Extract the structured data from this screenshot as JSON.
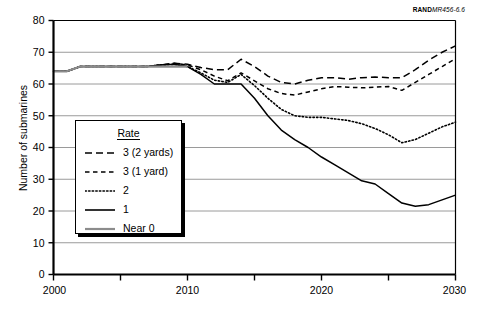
{
  "source_note": {
    "bold": "RAND",
    "italic": "MR456-6.6"
  },
  "legend": {
    "title": "Rate",
    "items": [
      {
        "label": "3 (2 yards)",
        "style": "long-dash",
        "color": "#000000"
      },
      {
        "label": "3 (1 yard)",
        "style": "short-dash",
        "color": "#000000"
      },
      {
        "label": "2",
        "style": "dotted",
        "color": "#000000"
      },
      {
        "label": "1",
        "style": "solid",
        "color": "#000000"
      },
      {
        "label": "Near 0",
        "style": "solid",
        "color": "#8c8c8c"
      }
    ]
  },
  "chart_data": {
    "type": "line",
    "title": "",
    "xlabel": "",
    "ylabel": "Number of submarines",
    "xlim": [
      2000,
      2030
    ],
    "ylim": [
      0,
      80
    ],
    "yticks": [
      0,
      10,
      20,
      30,
      40,
      50,
      60,
      70,
      80
    ],
    "ytick_labels": [
      "0",
      "10",
      "20",
      "30",
      "40",
      "50",
      "60",
      "70",
      "80"
    ],
    "xticks": [
      2000,
      2005,
      2010,
      2015,
      2020,
      2025,
      2030
    ],
    "xtick_labels": [
      "2000",
      "",
      "2010",
      "",
      "2020",
      "",
      "2030"
    ],
    "grid": "horizontal",
    "legend_position": "inside-left",
    "series": [
      {
        "name": "3 (2 yards)",
        "style": "long-dash",
        "color": "#000000",
        "x": [
          2000,
          2001,
          2002,
          2003,
          2004,
          2005,
          2006,
          2007,
          2008,
          2009,
          2010,
          2011,
          2012,
          2013,
          2014,
          2015,
          2016,
          2017,
          2018,
          2019,
          2020,
          2021,
          2022,
          2023,
          2024,
          2025,
          2026,
          2027,
          2028,
          2029,
          2030
        ],
        "values": [
          64,
          64,
          65.5,
          65.5,
          65.5,
          65.5,
          65.5,
          65.5,
          66,
          66.5,
          66.2,
          65.2,
          64.5,
          64.5,
          67.8,
          65.5,
          62.5,
          60.5,
          60,
          61.2,
          62,
          62,
          61.5,
          62,
          62.2,
          62,
          62,
          64.5,
          67.5,
          70,
          72
        ]
      },
      {
        "name": "3 (1 yard)",
        "style": "short-dash",
        "color": "#000000",
        "x": [
          2000,
          2001,
          2002,
          2003,
          2004,
          2005,
          2006,
          2007,
          2008,
          2009,
          2010,
          2011,
          2012,
          2013,
          2014,
          2015,
          2016,
          2017,
          2018,
          2019,
          2020,
          2021,
          2022,
          2023,
          2024,
          2025,
          2026,
          2027,
          2028,
          2029,
          2030
        ],
        "values": [
          64,
          64,
          65.5,
          65.5,
          65.5,
          65.5,
          65.5,
          65.5,
          66,
          66.5,
          66,
          64.5,
          62.5,
          61,
          63.5,
          61,
          58.5,
          57,
          56.5,
          57.5,
          58.5,
          59.2,
          59,
          58.8,
          59,
          59.2,
          58,
          60.5,
          63,
          65.5,
          68
        ]
      },
      {
        "name": "2",
        "style": "dotted",
        "color": "#000000",
        "x": [
          2000,
          2001,
          2002,
          2003,
          2004,
          2005,
          2006,
          2007,
          2008,
          2009,
          2010,
          2011,
          2012,
          2013,
          2014,
          2015,
          2016,
          2017,
          2018,
          2019,
          2020,
          2021,
          2022,
          2023,
          2024,
          2025,
          2026,
          2027,
          2028,
          2029,
          2030
        ],
        "values": [
          64,
          64,
          65.5,
          65.5,
          65.5,
          65.5,
          65.5,
          65.5,
          66,
          66.2,
          65.5,
          63.5,
          61.2,
          60.5,
          63,
          59.5,
          55.5,
          52,
          50,
          49.5,
          49.5,
          49,
          48.5,
          47.5,
          46,
          44,
          41.5,
          42.5,
          44.5,
          46.5,
          48
        ]
      },
      {
        "name": "1",
        "style": "solid",
        "color": "#000000",
        "x": [
          2000,
          2001,
          2002,
          2003,
          2004,
          2005,
          2006,
          2007,
          2008,
          2009,
          2010,
          2011,
          2012,
          2013,
          2014,
          2015,
          2016,
          2017,
          2018,
          2019,
          2020,
          2021,
          2022,
          2023,
          2024,
          2025,
          2026,
          2027,
          2028,
          2029,
          2030
        ],
        "values": [
          64,
          64,
          65.5,
          65.5,
          65.5,
          65.5,
          65.5,
          65.5,
          66,
          66.2,
          65.5,
          63,
          60,
          60,
          60,
          55.5,
          50,
          45.5,
          42.5,
          40,
          37,
          34.5,
          32,
          29.5,
          28.5,
          25.5,
          22.5,
          21.5,
          22,
          23.5,
          25
        ]
      },
      {
        "name": "Near 0",
        "style": "solid",
        "color": "#8c8c8c",
        "x": [
          2000,
          2001,
          2002,
          2003,
          2004,
          2005,
          2006,
          2007,
          2008,
          2009,
          2010
        ],
        "values": [
          64,
          64,
          65.5,
          65.5,
          65.5,
          65.5,
          65.5,
          65.5,
          65.5,
          65.5,
          65.5
        ]
      }
    ]
  }
}
